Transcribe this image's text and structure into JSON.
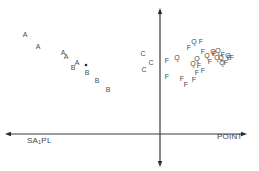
{
  "chart_data": {
    "type": "scatter",
    "title": "",
    "xlabel_left": "SA1PL",
    "xlabel_right": "POINT",
    "ylabel": "",
    "grid": false,
    "legend": null,
    "axes": {
      "horizontal": {
        "y": 134,
        "x_start": 5,
        "x_end": 247,
        "arrows": [
          "left",
          "right"
        ]
      },
      "vertical": {
        "x": 160,
        "y_start": 8,
        "y_end": 167,
        "arrows": [
          "up",
          "down"
        ]
      }
    },
    "series": [
      {
        "name": "A",
        "points": [
          {
            "x": 25,
            "y": 34
          },
          {
            "x": 38,
            "y": 46
          },
          {
            "x": 63,
            "y": 52
          },
          {
            "x": 66,
            "y": 56
          },
          {
            "x": 77,
            "y": 62
          }
        ]
      },
      {
        "name": "B",
        "points": [
          {
            "x": 73,
            "y": 67
          },
          {
            "x": 87,
            "y": 72
          },
          {
            "x": 97,
            "y": 80
          },
          {
            "x": 108,
            "y": 89
          }
        ]
      },
      {
        "name": "dot",
        "points": [
          {
            "x": 86,
            "y": 65
          }
        ]
      },
      {
        "name": "C",
        "points": [
          {
            "x": 143,
            "y": 53
          },
          {
            "x": 151,
            "y": 62
          },
          {
            "x": 144,
            "y": 69
          }
        ]
      },
      {
        "name": "Q",
        "points": [
          {
            "x": 177,
            "y": 57
          },
          {
            "x": 194,
            "y": 41
          },
          {
            "x": 197,
            "y": 58
          },
          {
            "x": 193,
            "y": 63
          },
          {
            "x": 207,
            "y": 55
          },
          {
            "x": 213,
            "y": 51
          },
          {
            "x": 217,
            "y": 57
          },
          {
            "x": 218,
            "y": 50
          },
          {
            "x": 221,
            "y": 57
          },
          {
            "x": 222,
            "y": 62
          },
          {
            "x": 228,
            "y": 55
          }
        ]
      },
      {
        "name": "F",
        "points": [
          {
            "x": 201,
            "y": 41
          },
          {
            "x": 189,
            "y": 47
          },
          {
            "x": 203,
            "y": 51
          },
          {
            "x": 167,
            "y": 60
          },
          {
            "x": 199,
            "y": 65
          },
          {
            "x": 197,
            "y": 72
          },
          {
            "x": 203,
            "y": 70
          },
          {
            "x": 210,
            "y": 61
          },
          {
            "x": 214,
            "y": 53
          },
          {
            "x": 223,
            "y": 54
          },
          {
            "x": 226,
            "y": 62
          },
          {
            "x": 229,
            "y": 57
          },
          {
            "x": 232,
            "y": 57
          },
          {
            "x": 167,
            "y": 76
          },
          {
            "x": 182,
            "y": 78
          },
          {
            "x": 186,
            "y": 84
          },
          {
            "x": 194,
            "y": 79
          }
        ]
      }
    ],
    "xlim": [
      0,
      259
    ],
    "ylim": [
      0,
      171
    ]
  },
  "labels": {
    "left_axis": {
      "main": "SA",
      "sub": "1",
      "tail": "PL"
    },
    "right_axis": "POINT"
  }
}
